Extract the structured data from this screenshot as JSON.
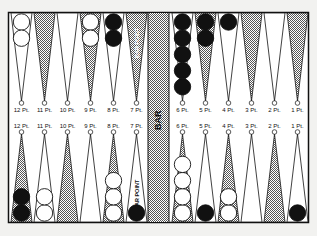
{
  "board": {
    "bar_label": "BAR",
    "bar_point_label_top": "BAR POINT",
    "bar_point_label_bottom": "BAR POINT",
    "colors": {
      "background": "#f2f2f0",
      "line": "#111111",
      "stipple": "#9a9a9a",
      "black_checker": "#111111",
      "white_checker": "#ffffff"
    }
  },
  "top_points": [
    {
      "label": "12 Pt.",
      "shaded": false,
      "checkers": {
        "color": "white",
        "count": 2
      }
    },
    {
      "label": "11 Pt.",
      "shaded": true,
      "checkers": null
    },
    {
      "label": "10 Pt.",
      "shaded": false,
      "checkers": null
    },
    {
      "label": "9 Pt.",
      "shaded": true,
      "checkers": {
        "color": "white",
        "count": 2
      }
    },
    {
      "label": "8 Pt.",
      "shaded": false,
      "checkers": {
        "color": "black",
        "count": 2
      }
    },
    {
      "label": "7 Pt.",
      "shaded": true,
      "checkers": null
    },
    {
      "label": "6 Pt.",
      "shaded": false,
      "checkers": {
        "color": "black",
        "count": 5
      }
    },
    {
      "label": "5 Pt.",
      "shaded": true,
      "checkers": {
        "color": "black",
        "count": 2
      }
    },
    {
      "label": "4 Pt.",
      "shaded": false,
      "checkers": {
        "color": "black",
        "count": 1
      }
    },
    {
      "label": "3 Pt.",
      "shaded": true,
      "checkers": null
    },
    {
      "label": "2 Pt.",
      "shaded": false,
      "checkers": null
    },
    {
      "label": "1 Pt.",
      "shaded": true,
      "checkers": null
    }
  ],
  "bottom_points": [
    {
      "label": "12 Pt.",
      "shaded": true,
      "checkers": {
        "color": "black",
        "count": 2
      }
    },
    {
      "label": "11 Pt.",
      "shaded": false,
      "checkers": {
        "color": "white",
        "count": 2
      }
    },
    {
      "label": "10 Pt.",
      "shaded": true,
      "checkers": null
    },
    {
      "label": "9 Pt.",
      "shaded": false,
      "checkers": null
    },
    {
      "label": "8 Pt.",
      "shaded": true,
      "checkers": {
        "color": "white",
        "count": 3
      }
    },
    {
      "label": "7 Pt.",
      "shaded": false,
      "checkers": {
        "color": "black",
        "count": 1
      }
    },
    {
      "label": "6 Pt.",
      "shaded": true,
      "checkers": {
        "color": "white",
        "count": 4
      }
    },
    {
      "label": "5 Pt.",
      "shaded": false,
      "checkers": {
        "color": "black",
        "count": 1
      }
    },
    {
      "label": "4 Pt.",
      "shaded": true,
      "checkers": {
        "color": "white",
        "count": 2
      }
    },
    {
      "label": "3 Pt.",
      "shaded": false,
      "checkers": null
    },
    {
      "label": "2 Pt.",
      "shaded": true,
      "checkers": null
    },
    {
      "label": "1 Pt.",
      "shaded": false,
      "checkers": {
        "color": "black",
        "count": 1
      }
    }
  ]
}
